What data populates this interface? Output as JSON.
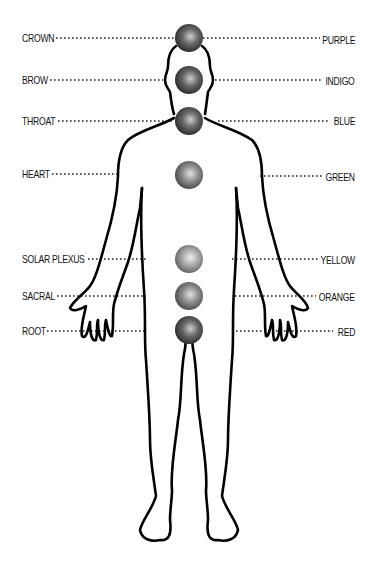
{
  "chakras": [
    {
      "name": "CROWN",
      "color": "PURPLE",
      "y": 38,
      "left_line_end": 175,
      "right_line_start": 203
    },
    {
      "name": "BROW",
      "color": "INDIGO",
      "y": 80,
      "left_line_end": 163,
      "right_line_start": 215
    },
    {
      "name": "THROAT",
      "color": "BLUE",
      "y": 121,
      "left_line_end": 173,
      "right_line_start": 218
    },
    {
      "name": "HEART",
      "color": "GREEN",
      "y": 174,
      "left_line_end": 118,
      "right_line_start": 260
    },
    {
      "name": "SOLAR PLEXUS",
      "color": "YELLOW",
      "y": 259,
      "left_line_end": 146,
      "right_line_start": 232
    },
    {
      "name": "SACRAL",
      "color": "ORANGE",
      "y": 296,
      "left_line_end": 146,
      "right_line_start": 235
    },
    {
      "name": "ROOT",
      "color": "RED",
      "y": 330,
      "left_line_end": 146,
      "right_line_start": 236
    }
  ],
  "labels": {
    "left": [
      "CROWN",
      "BROW",
      "THROAT",
      "HEART",
      "SOLAR PLEXUS",
      "SACRAL",
      "ROOT"
    ],
    "right": [
      "PURPLE",
      "INDIGO",
      "BLUE",
      "GREEN",
      "YELLOW",
      "ORANGE",
      "RED"
    ]
  },
  "style": {
    "sphere_dark": "#2a2a2a",
    "sphere_mid": "#6e6e6e",
    "sphere_light": "#d8d8d8",
    "outline": "#000000"
  }
}
